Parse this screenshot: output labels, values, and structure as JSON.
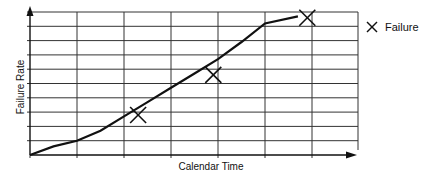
{
  "chart_data": {
    "type": "line",
    "title": "",
    "xlabel": "Calendar Time",
    "ylabel": "Failure Rate",
    "grid": true,
    "legend_position": "right",
    "legend": [
      {
        "marker": "x",
        "label": "Failure"
      }
    ],
    "x_ticks": 7,
    "y_ticks": 11,
    "xlim": [
      0,
      6.5
    ],
    "ylim": [
      0,
      10
    ],
    "series": [
      {
        "name": "Failure rate curve",
        "style": "line",
        "x": [
          0,
          0.5,
          1,
          1.5,
          2,
          2.5,
          3,
          3.5,
          4,
          4.5,
          5,
          5.7
        ],
        "y": [
          0,
          0.6,
          1.0,
          1.7,
          2.7,
          3.7,
          4.7,
          5.7,
          6.7,
          7.9,
          9.2,
          9.7
        ]
      },
      {
        "name": "Failure",
        "style": "marker-x",
        "x": [
          2.3,
          3.9,
          5.9
        ],
        "y": [
          2.8,
          5.6,
          9.6
        ]
      }
    ]
  },
  "labels": {
    "xlabel": "Calendar Time",
    "ylabel": "Failure Rate",
    "legend_failure": "Failure"
  },
  "colors": {
    "line": "#111111",
    "grid": "#222222",
    "background": "#ffffff"
  }
}
